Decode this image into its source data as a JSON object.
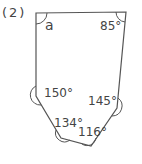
{
  "problem_number": "(2)",
  "figure": {
    "type": "hexagon",
    "vertices": [
      [
        36,
        13
      ],
      [
        126,
        12
      ],
      [
        117,
        108
      ],
      [
        91,
        146
      ],
      [
        61,
        138
      ],
      [
        36,
        96
      ]
    ],
    "stroke": "#555555"
  },
  "angles": {
    "a": "a",
    "top_right": "85°",
    "left": "150°",
    "right": "145°",
    "bottom_left": "134°",
    "bottom_right": "116°"
  }
}
